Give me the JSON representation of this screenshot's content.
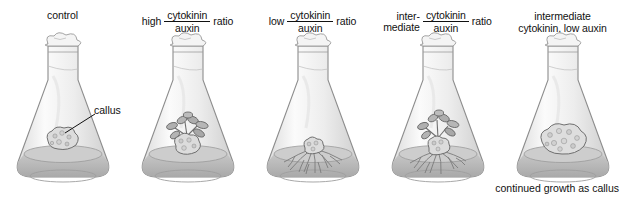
{
  "figure": {
    "title_caption": "continued growth as callus",
    "annotation": {
      "label": "callus"
    },
    "colors": {
      "background": "#ffffff",
      "text": "#111111",
      "glass_light": "#f2f2f2",
      "glass_shade": "#d8d8d8",
      "medium": "#b4b4b4",
      "medium_surface": "#cfcfcf",
      "callus": "#d9d9d9",
      "callus_outline": "#6e6e6e",
      "plant": "#8a8a8a",
      "plant_dark": "#5a5a5a",
      "roots": "#7a7a7a",
      "plug": "#efefef",
      "plug_outline": "#9a9a9a"
    },
    "panels": [
      {
        "id": "control",
        "label_type": "plain",
        "label_text": "control",
        "numerator": "",
        "denominator": "",
        "prefix": "",
        "suffix": "",
        "contents": "callus-only"
      },
      {
        "id": "high-cytokinin-auxin",
        "label_type": "ratio",
        "label_text": "",
        "prefix": "high",
        "numerator": "cytokinin",
        "denominator": "auxin",
        "suffix": "ratio",
        "contents": "shoots"
      },
      {
        "id": "low-cytokinin-auxin",
        "label_type": "ratio",
        "label_text": "",
        "prefix": "low",
        "numerator": "cytokinin",
        "denominator": "auxin",
        "suffix": "ratio",
        "contents": "roots"
      },
      {
        "id": "intermediate-cytokinin-auxin",
        "label_type": "ratio-wrapped",
        "label_text": "",
        "prefix_line1": "inter-",
        "prefix_line2": "mediate",
        "numerator": "cytokinin",
        "denominator": "auxin",
        "suffix": "ratio",
        "contents": "shoots-and-roots"
      },
      {
        "id": "intermediate-cytokinin-low-auxin",
        "label_type": "two-line",
        "label_line1": "intermediate",
        "label_line2": "cytokinin, low auxin",
        "numerator": "",
        "denominator": "",
        "prefix": "",
        "suffix": "",
        "contents": "large-callus"
      }
    ]
  }
}
